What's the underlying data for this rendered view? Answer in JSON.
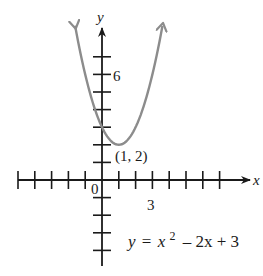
{
  "chart_data": {
    "type": "line",
    "title": "",
    "equation": {
      "lhs": "y",
      "equals": "=",
      "x_var": "x",
      "exponent": "2",
      "rest": "– 2x + 3",
      "full": "y = x^2 – 2x + 3"
    },
    "xlabel": "x",
    "ylabel": "y",
    "xlim": [
      -6,
      9
    ],
    "ylim": [
      -5,
      8.5
    ],
    "grid": false,
    "x_ticks": [
      -5,
      -4,
      -3,
      -2,
      -1,
      1,
      2,
      3,
      4,
      5,
      6,
      7
    ],
    "y_ticks": [
      -4,
      -3,
      -2,
      -1,
      1,
      2,
      3,
      4,
      5,
      6,
      7
    ],
    "tick_labels": {
      "origin": "0",
      "x": "3",
      "y": "6"
    },
    "vertex": {
      "x": 1,
      "y": 2,
      "label": "(1, 2)"
    },
    "series": [
      {
        "name": "y = x^2 - 2x + 3",
        "color": "#8c8c8c",
        "x": [
          -1.6,
          -1,
          0,
          1,
          2,
          3,
          3.6
        ],
        "y": [
          8.76,
          6,
          3,
          2,
          3,
          6,
          8.76
        ]
      }
    ],
    "axis_color": "#1a1a1a"
  }
}
